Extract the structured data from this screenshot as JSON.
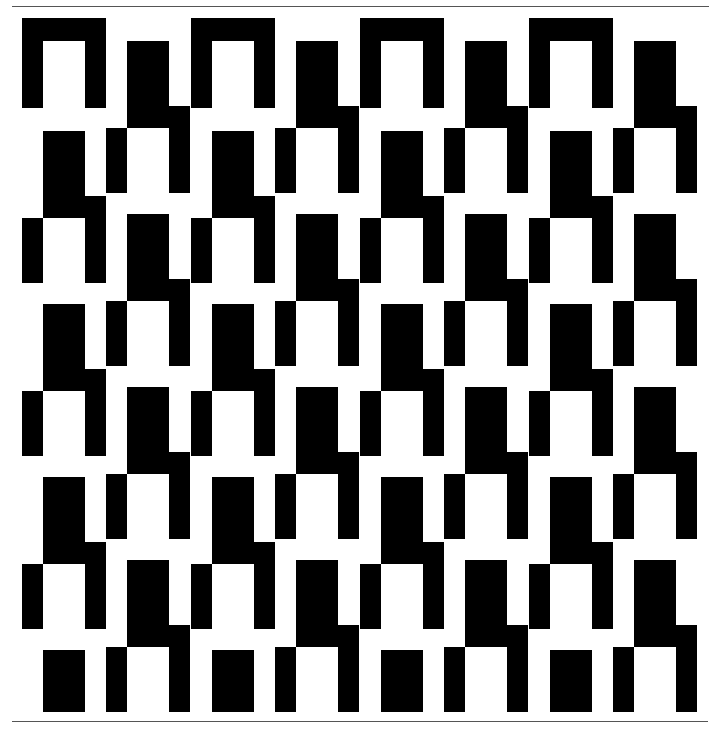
{
  "artwork": {
    "description": "Black and white geometric op-art tessellation of interlocking step motifs",
    "colors": {
      "ink": "#000000",
      "paper": "#ffffff",
      "rule": "#555555"
    },
    "rules": [
      {
        "name": "top-rule",
        "x": 12,
        "y": 6,
        "w": 697
      },
      {
        "name": "bottom-rule",
        "x": 12,
        "y": 721,
        "w": 696
      }
    ],
    "clip_bottom": 712,
    "grid": {
      "period_x": 169,
      "period_y": 173,
      "columns": 4
    },
    "arches": {
      "y": 18,
      "x0": 22,
      "width": 84,
      "height": 90,
      "bar": 21,
      "top": 23
    },
    "motif": {
      "block_w": 42,
      "block_h": 87,
      "leg_w": 21,
      "right_leg_offset_y": 65,
      "right_leg_h": 87,
      "left_leg_offset_y": 87,
      "left_leg_h": 65
    },
    "series": [
      {
        "name": "column-a",
        "x0": 43,
        "y0": 131,
        "rows": 4
      },
      {
        "name": "column-b",
        "x0": 127,
        "y0": 41,
        "rows": 4
      }
    ]
  }
}
